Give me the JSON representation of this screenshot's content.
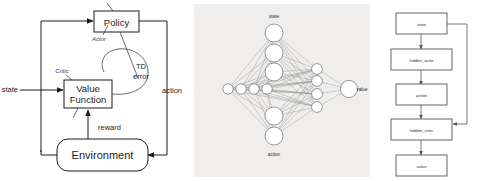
{
  "figure": {
    "panels": [
      {
        "id": "actor-critic-diagram",
        "type": "block-diagram",
        "nodes": [
          {
            "id": "policy",
            "label": "Policy",
            "shape": "rect"
          },
          {
            "id": "value_function",
            "label": "Value\nFunction",
            "label_line1": "Value",
            "label_line2": "Function",
            "shape": "rect"
          },
          {
            "id": "environment",
            "label": "Environment",
            "shape": "rounded-rect"
          }
        ],
        "annotations": [
          {
            "id": "actor",
            "label": "Actor",
            "style": "italic",
            "points_to": "policy"
          },
          {
            "id": "critic",
            "label": "Critic",
            "style": "italic",
            "points_to": "value_function"
          },
          {
            "id": "td_error_line1",
            "label": "TD"
          },
          {
            "id": "td_error_line2",
            "label": "error"
          }
        ],
        "signals": [
          {
            "id": "state",
            "label": "state"
          },
          {
            "id": "action",
            "label": "action"
          },
          {
            "id": "reward",
            "label": "reward"
          }
        ]
      },
      {
        "id": "neural-network-diagram",
        "type": "neural-network",
        "labels": {
          "input_top": "state",
          "input_bottom": "action",
          "output": "value"
        },
        "layers": [
          {
            "name": "input",
            "count": 5,
            "note": "state units top, action units bottom"
          },
          {
            "name": "hidden_actor",
            "count": 4,
            "orientation": "horizontal"
          },
          {
            "name": "hidden_critic",
            "count": 4,
            "orientation": "vertical"
          },
          {
            "name": "output",
            "count": 1
          }
        ]
      },
      {
        "id": "computation-graph",
        "type": "flowchart",
        "boxes": [
          {
            "id": "state",
            "label": "state"
          },
          {
            "id": "hidden_actor",
            "label": "hidden_actor"
          },
          {
            "id": "action",
            "label": "action"
          },
          {
            "id": "hidden_critic",
            "label": "hidden_critic"
          },
          {
            "id": "value",
            "label": "value"
          }
        ],
        "edges": [
          {
            "from": "state",
            "to": "hidden_actor"
          },
          {
            "from": "hidden_actor",
            "to": "action"
          },
          {
            "from": "action",
            "to": "hidden_critic"
          },
          {
            "from": "hidden_critic",
            "to": "value"
          },
          {
            "from": "state",
            "to": "hidden_critic",
            "kind": "skip"
          }
        ]
      }
    ],
    "colors": {
      "line": "#1b1b1b",
      "net_background": "#efeeec",
      "edge": "#8c8c8c",
      "node_stroke": "#7d7d7d",
      "flow_stroke": "#555555"
    }
  }
}
